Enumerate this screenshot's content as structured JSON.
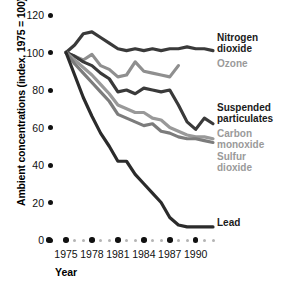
{
  "chart_data": {
    "type": "line",
    "title": "",
    "xlabel": "Year",
    "ylabel": "Ambient concentrations (index, 1975 = 100)",
    "xlim": [
      1974,
      1992
    ],
    "ylim": [
      0,
      120
    ],
    "grid": false,
    "legend_position": "right-inline",
    "x_tick_labels": [
      "1975",
      "1978",
      "1981",
      "1984",
      "1987",
      "1990"
    ],
    "x_tick_values": [
      1975,
      1978,
      1981,
      1984,
      1987,
      1990
    ],
    "y_tick_labels": [
      "0",
      "20",
      "40",
      "60",
      "80",
      "100",
      "120"
    ],
    "y_tick_values": [
      0,
      20,
      40,
      60,
      80,
      100,
      120
    ],
    "x": [
      1975,
      1976,
      1977,
      1978,
      1979,
      1980,
      1981,
      1982,
      1983,
      1984,
      1985,
      1986,
      1987,
      1988,
      1989,
      1990,
      1991,
      1992
    ],
    "series": [
      {
        "name": "Nitrogen dioxide",
        "color": "#3a3a3a",
        "label_style": "bold",
        "values": [
          100,
          104,
          110,
          111,
          108,
          105,
          102,
          101,
          102,
          101,
          102,
          101,
          102,
          102,
          103,
          102,
          102,
          101
        ]
      },
      {
        "name": "Ozone",
        "color": "#8f8f8f",
        "label_style": "gray",
        "values": [
          100,
          98,
          96,
          99,
          93,
          91,
          87,
          88,
          95,
          90,
          89,
          88,
          87,
          93,
          null,
          null,
          null,
          null
        ]
      },
      {
        "name": "Suspended particulates",
        "color": "#3a3a3a",
        "label_style": "bold",
        "values": [
          100,
          98,
          95,
          93,
          89,
          86,
          79,
          80,
          78,
          81,
          80,
          79,
          80,
          72,
          63,
          59,
          65,
          62
        ]
      },
      {
        "name": "Carbon monoxide",
        "color": "#999999",
        "label_style": "gray",
        "values": [
          100,
          96,
          92,
          88,
          83,
          78,
          72,
          70,
          68,
          68,
          65,
          64,
          60,
          58,
          56,
          55,
          55,
          54
        ]
      },
      {
        "name": "Sulfur dioxide",
        "color": "#7c7c7c",
        "label_style": "gray",
        "values": [
          100,
          94,
          89,
          84,
          79,
          74,
          67,
          65,
          63,
          61,
          62,
          58,
          57,
          55,
          54,
          54,
          53,
          52
        ]
      },
      {
        "name": "Lead",
        "color": "#2b2b2b",
        "label_style": "bold",
        "values": [
          100,
          88,
          76,
          66,
          57,
          50,
          42,
          42,
          35,
          30,
          25,
          20,
          12,
          8,
          7,
          7,
          7,
          7
        ]
      }
    ],
    "annotations": [
      {
        "text": "Nitrogen\ndioxide",
        "style": "bold"
      },
      {
        "text": "Ozone",
        "style": "gray"
      },
      {
        "text": "Suspended\nparticulates",
        "style": "bold"
      },
      {
        "text": "Carbon\nmonoxide",
        "style": "gray"
      },
      {
        "text": "Sulfur\ndioxide",
        "style": "gray"
      },
      {
        "text": "Lead",
        "style": "bold"
      }
    ]
  }
}
